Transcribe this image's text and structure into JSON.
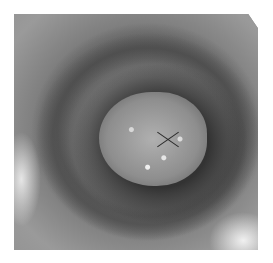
{
  "image": {
    "description": "Grayscale endoscopic view looking down a tubular lumen toward a lobulated, glistening tissue surface with converging folds",
    "colors": {
      "background": "#ffffff",
      "wall": "#8a8a8a",
      "lumen_shadow": "#2a2a2a",
      "tissue": "#b0b0b0",
      "highlight": "#f0f0f0"
    }
  }
}
